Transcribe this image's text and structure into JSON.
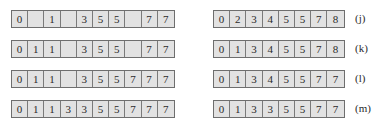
{
  "left_arrays": [
    {
      "cells": [
        "0",
        "",
        "1",
        "",
        "3",
        "5",
        "5",
        "",
        "7",
        "7"
      ]
    },
    {
      "cells": [
        "0",
        "1",
        "1",
        "",
        "3",
        "5",
        "5",
        "",
        "7",
        "7"
      ]
    },
    {
      "cells": [
        "0",
        "1",
        "1",
        "",
        "3",
        "5",
        "5",
        "7",
        "7",
        "7"
      ]
    },
    {
      "cells": [
        "0",
        "1",
        "1",
        "3",
        "3",
        "5",
        "5",
        "7",
        "7",
        "7"
      ]
    }
  ],
  "right_arrays": [
    {
      "cells": [
        "0",
        "2",
        "3",
        "4",
        "5",
        "5",
        "7",
        "8"
      ],
      "label": "(j)"
    },
    {
      "cells": [
        "0",
        "1",
        "3",
        "4",
        "5",
        "5",
        "7",
        "8"
      ],
      "label": "(k)"
    },
    {
      "cells": [
        "0",
        "1",
        "3",
        "4",
        "5",
        "5",
        "7",
        "7"
      ],
      "label": "(l)"
    },
    {
      "cells": [
        "0",
        "1",
        "3",
        "3",
        "5",
        "5",
        "7",
        "7"
      ],
      "label": "(m)"
    }
  ]
}
